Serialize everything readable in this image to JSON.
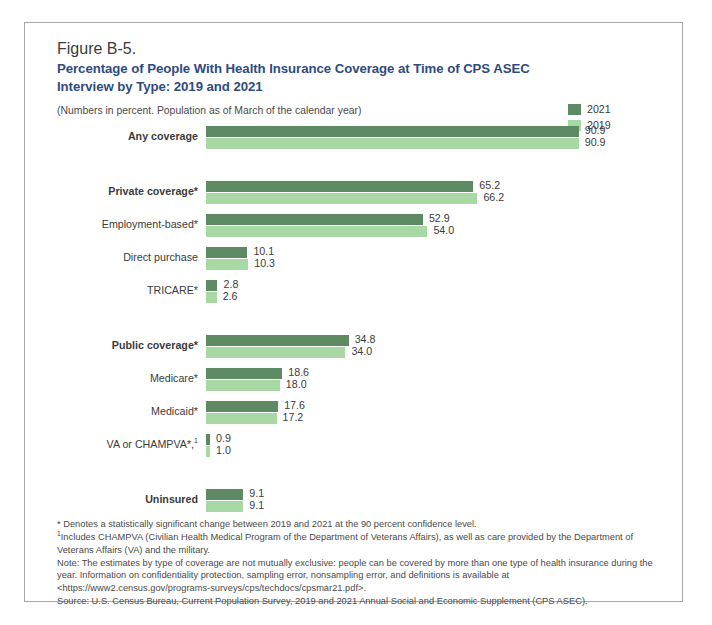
{
  "figure": {
    "number": "Figure B-5.",
    "title": "Percentage of People With Health Insurance Coverage at Time of CPS ASEC Interview by Type: 2019 and 2021",
    "subtitle": "(Numbers in percent. Population as of March of the calendar year)"
  },
  "legend": {
    "items": [
      {
        "label": "2021",
        "color": "#5d8a63"
      },
      {
        "label": "2019",
        "color": "#a8d8a4"
      }
    ]
  },
  "colors": {
    "series_2021": "#5d8a63",
    "series_2019": "#a8d8a4",
    "title": "#2f4b80",
    "text": "#3b3b3b",
    "frame": "#a7a7a7"
  },
  "footnotes": {
    "asterisk": "* Denotes a statistically significant change between 2019 and 2021 at the 90 percent confidence level.",
    "one_sup": "1",
    "one": "Includes CHAMPVA (Civilian Health Medical Program of the Department of Veterans Affairs), as well as care provided by the Department of Veterans Affairs (VA) and the military.",
    "note": "Note: The estimates by type of coverage are not mutually exclusive: people can be covered by more than one type of health insurance during the year. Information on confidentiality protection, sampling error, nonsampling error, and definitions is available at <https://www2.census.gov/programs-surveys/cps/techdocs/cpsmar21.pdf>.",
    "source": "Source: U.S. Census Bureau, Current Population Survey, 2019 and 2021 Annual Social and Economic Supplement (CPS ASEC)."
  },
  "chart_data": {
    "type": "bar",
    "orientation": "horizontal",
    "title": "Percentage of People With Health Insurance Coverage at Time of CPS ASEC Interview by Type: 2019 and 2021",
    "subtitle": "(Numbers in percent. Population as of March of the calendar year)",
    "xlabel": "",
    "ylabel": "",
    "xlim": [
      0,
      100
    ],
    "grid": false,
    "legend_position": "top-right",
    "categories": [
      "Any coverage",
      "Private coverage*",
      "Employment-based*",
      "Direct purchase",
      "TRICARE*",
      "Public coverage*",
      "Medicare*",
      "Medicaid*",
      "VA or CHAMPVA*, 1",
      "Uninsured"
    ],
    "series": [
      {
        "name": "2021",
        "color": "#5d8a63",
        "values": [
          90.9,
          65.2,
          52.9,
          10.1,
          2.8,
          34.8,
          18.6,
          17.6,
          0.9,
          9.1
        ]
      },
      {
        "name": "2019",
        "color": "#a8d8a4",
        "values": [
          90.9,
          66.2,
          54.0,
          10.3,
          2.6,
          34.0,
          18.0,
          17.2,
          1.0,
          9.1
        ]
      }
    ],
    "rows": [
      {
        "label": "Any coverage",
        "bold": true,
        "star": false,
        "sup": "",
        "group_start": false,
        "v2021": "90.9",
        "v2019": "90.9",
        "n2021": 90.9,
        "n2019": 90.9
      },
      {
        "label": "Private coverage",
        "bold": true,
        "star": true,
        "sup": "",
        "group_start": true,
        "v2021": "65.2",
        "v2019": "66.2",
        "n2021": 65.2,
        "n2019": 66.2
      },
      {
        "label": "Employment-based",
        "bold": false,
        "star": true,
        "sup": "",
        "group_start": false,
        "v2021": "52.9",
        "v2019": "54.0",
        "n2021": 52.9,
        "n2019": 54.0
      },
      {
        "label": "Direct purchase",
        "bold": false,
        "star": false,
        "sup": "",
        "group_start": false,
        "v2021": "10.1",
        "v2019": "10.3",
        "n2021": 10.1,
        "n2019": 10.3
      },
      {
        "label": "TRICARE",
        "bold": false,
        "star": true,
        "sup": "",
        "group_start": false,
        "v2021": "2.8",
        "v2019": "2.6",
        "n2021": 2.8,
        "n2019": 2.6
      },
      {
        "label": "Public coverage",
        "bold": true,
        "star": true,
        "sup": "",
        "group_start": true,
        "v2021": "34.8",
        "v2019": "34.0",
        "n2021": 34.8,
        "n2019": 34.0
      },
      {
        "label": "Medicare",
        "bold": false,
        "star": true,
        "sup": "",
        "group_start": false,
        "v2021": "18.6",
        "v2019": "18.0",
        "n2021": 18.6,
        "n2019": 18.0
      },
      {
        "label": "Medicaid",
        "bold": false,
        "star": true,
        "sup": "",
        "group_start": false,
        "v2021": "17.6",
        "v2019": "17.2",
        "n2021": 17.6,
        "n2019": 17.2
      },
      {
        "label": "VA or CHAMPVA",
        "bold": false,
        "star": true,
        "sup": "1",
        "group_start": false,
        "v2021": "0.9",
        "v2019": "1.0",
        "n2021": 0.9,
        "n2019": 1.0
      },
      {
        "label": "Uninsured",
        "bold": true,
        "star": false,
        "sup": "",
        "group_start": true,
        "v2021": "9.1",
        "v2019": "9.1",
        "n2021": 9.1,
        "n2019": 9.1
      }
    ]
  }
}
